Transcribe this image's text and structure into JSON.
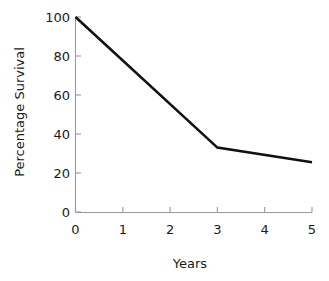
{
  "chart_data": {
    "type": "line",
    "title": "",
    "xlabel": "Years",
    "ylabel": "Percentage Survival",
    "x": [
      0,
      1,
      2,
      3,
      4,
      5
    ],
    "series": [
      {
        "name": "Percentage Survival",
        "points": [
          {
            "x": 0,
            "y": 100
          },
          {
            "x": 3,
            "y": 33
          },
          {
            "x": 5,
            "y": 25.5
          }
        ],
        "color": "#111111"
      }
    ],
    "xlim": [
      0,
      5
    ],
    "ylim": [
      0,
      100
    ],
    "xticks": [
      "0",
      "1",
      "2",
      "3",
      "4",
      "5"
    ],
    "yticks": [
      "0",
      "20",
      "40",
      "60",
      "80",
      "100"
    ],
    "xtick_values": [
      0,
      1,
      2,
      3,
      4,
      5
    ],
    "ytick_values": [
      0,
      20,
      40,
      60,
      80,
      100
    ],
    "grid": false,
    "legend": false,
    "background_color": "#ffffff",
    "axis_color": "#9a9a9a",
    "text_color": "#1a1a1a"
  },
  "axes": {
    "y_title": "Percentage Survival",
    "x_title": "Years",
    "y_labels": [
      "100",
      "80",
      "60",
      "40",
      "20",
      "0"
    ],
    "x_labels": [
      "0",
      "1",
      "2",
      "3",
      "4",
      "5"
    ]
  }
}
